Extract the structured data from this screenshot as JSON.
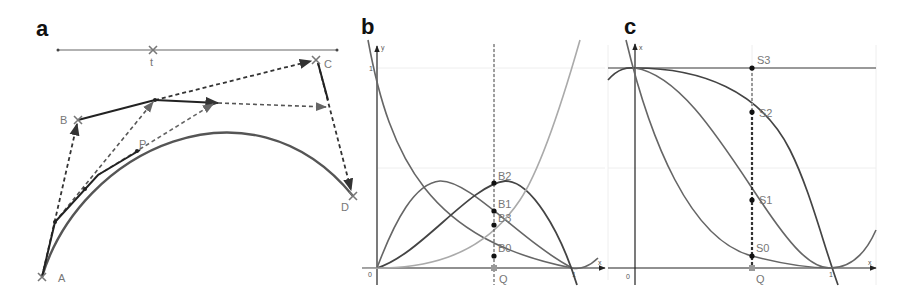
{
  "figure": {
    "panels": [
      {
        "id": "a",
        "label": "a",
        "slider": {
          "label": "t",
          "position": 0.34
        },
        "control_points": [
          "A",
          "B",
          "C",
          "D"
        ],
        "curve_point": "P",
        "description": "Cubic Bezier curve construction (de Casteljau) with control points A, B, C, D and point P at parameter t"
      },
      {
        "id": "b",
        "label": "b",
        "axes": {
          "x_label": "x",
          "y_label": "y",
          "origin_label": "0",
          "y_tick": "1",
          "x_tick": "1"
        },
        "marker": "Q",
        "points": [
          "B2",
          "B1",
          "B3",
          "B0"
        ],
        "description": "Bernstein basis polynomials B0..B3 evaluated at Q"
      },
      {
        "id": "c",
        "label": "c",
        "axes": {
          "x_label": "x",
          "y_label": "x",
          "origin_label": "0",
          "x_tick": "1"
        },
        "marker": "Q",
        "points": [
          "S3",
          "S2",
          "S1",
          "S0"
        ],
        "description": "Cumulative sums S0..S3 of Bernstein polynomials evaluated at Q"
      }
    ]
  },
  "labels": {
    "a": "a",
    "b": "b",
    "c": "c",
    "t": "t",
    "A": "A",
    "B": "B",
    "C": "C",
    "D": "D",
    "P": "P",
    "b_y": "y",
    "b_x": "x",
    "b_one": "1",
    "b_zero": "0",
    "b_xone": "1",
    "b_Q": "Q",
    "B0": "B0",
    "B1": "B1",
    "B2": "B2",
    "B3": "B3",
    "c_y": "x",
    "c_x": "x",
    "c_zero": "0",
    "c_xone": "1",
    "c_Q": "Q",
    "S0": "S0",
    "S1": "S1",
    "S2": "S2",
    "S3": "S3"
  },
  "colors": {
    "curve": "#555555",
    "construction": "#222222",
    "light_curve": "#999999",
    "label": "#777777"
  }
}
